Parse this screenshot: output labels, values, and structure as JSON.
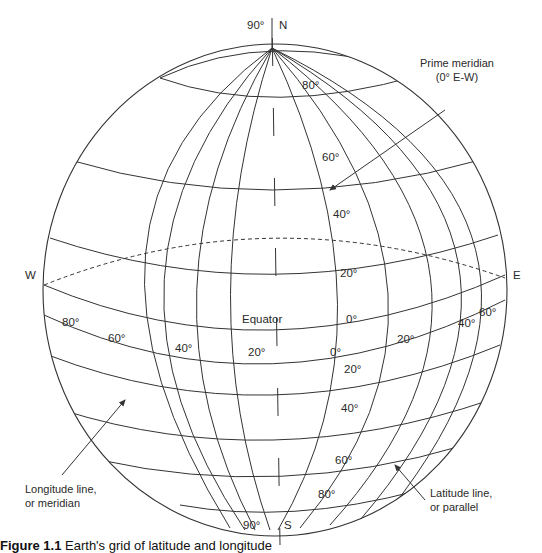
{
  "figure": {
    "caption_label": "Figure 1.1",
    "caption_text": "Earth's grid of latitude and longitude"
  },
  "poles": {
    "north": "N",
    "south": "S",
    "north_lat": "90°",
    "south_lat": "90°"
  },
  "directions": {
    "west": "W",
    "east": "E"
  },
  "equator_label": "Equator",
  "latitude_labels_north": [
    "80°",
    "60°",
    "40°",
    "20°",
    "0°"
  ],
  "latitude_labels_south": [
    "20°",
    "40°",
    "60°",
    "80°"
  ],
  "longitude_labels_west": [
    "80°",
    "60°",
    "40°",
    "20°",
    "0°"
  ],
  "longitude_labels_east": [
    "20°",
    "40°",
    "60°"
  ],
  "callouts": {
    "prime_meridian": {
      "line1": "Prime meridian",
      "line2": "(0° E-W)"
    },
    "longitude": {
      "line1": "Longitude line,",
      "line2": "or meridian"
    },
    "latitude": {
      "line1": "Latitude line,",
      "line2": "or parallel"
    }
  },
  "colors": {
    "line": "#333333",
    "background": "#ffffff"
  }
}
